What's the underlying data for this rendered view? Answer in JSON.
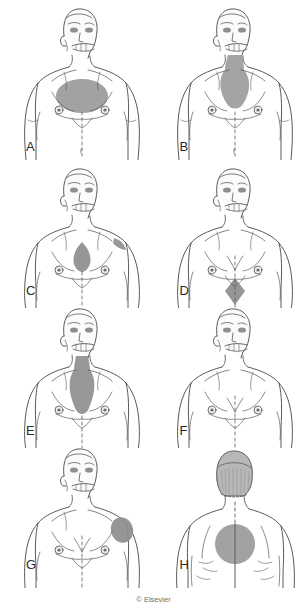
{
  "figure": {
    "copyright": "© Elsevier",
    "background_color": "#ffffff",
    "skin_fill": "#fbfbfa",
    "outline_color": "#5a5a5a",
    "shade_color": "#9a9a9a",
    "shade_color_dark": "#868686",
    "hair_color": "#b0b0b0",
    "columns": 2,
    "rows": 4,
    "panel_count": 8
  },
  "panels": [
    {
      "label": "A",
      "view": "anterior",
      "region_name": "upper-central-chest-oval",
      "description": "Large oval shaded area over upper sternum and medial chest",
      "shape": "ellipse"
    },
    {
      "label": "B",
      "view": "anterior",
      "region_name": "neck-to-sternum-band",
      "description": "Shaded area from anterior neck widening over the sternum",
      "shape": "neck-chest"
    },
    {
      "label": "C",
      "view": "anterior",
      "region_name": "sternum-and-left-shoulder",
      "description": "Narrow sternal shading with separate left shoulder patch",
      "shape": "sternal-plus-shoulder"
    },
    {
      "label": "D",
      "view": "anterior",
      "region_name": "epigastric-diamond",
      "description": "Diamond shaped shading over the epigastrium below the xiphoid",
      "shape": "diamond"
    },
    {
      "label": "E",
      "view": "anterior",
      "region_name": "neck-through-midchest-band",
      "description": "Vertical band from suprasternal notch down past the nipple line",
      "shape": "vertical-band"
    },
    {
      "label": "F",
      "view": "anterior",
      "region_name": "no-shading",
      "description": "Anterior torso with no shaded pain region",
      "shape": "none"
    },
    {
      "label": "G",
      "view": "anterior",
      "region_name": "left-shoulder-deltoid",
      "description": "Oval shading over the left shoulder and deltoid",
      "shape": "shoulder-oval"
    },
    {
      "label": "H",
      "view": "posterior",
      "region_name": "interscapular-circle",
      "description": "Circular shading over the upper back between the scapulae",
      "shape": "circle"
    }
  ]
}
